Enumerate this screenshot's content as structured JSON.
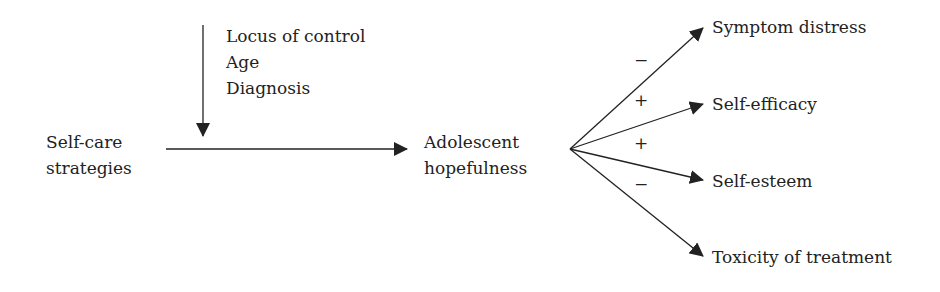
{
  "moderators": [
    "Locus of control",
    "Age",
    "Diagnosis"
  ],
  "source": {
    "line1": "Self-care",
    "line2": "strategies"
  },
  "mediator": {
    "line1": "Adolescent",
    "line2": "hopefulness"
  },
  "outcomes": [
    {
      "label": "Symptom distress",
      "sign": "−"
    },
    {
      "label": "Self-efficacy",
      "sign": "+"
    },
    {
      "label": "Self-esteem",
      "sign": "+"
    },
    {
      "label": "Toxicity of treatment",
      "sign": "−"
    }
  ],
  "colors": {
    "line": "#222222",
    "text": "#222222"
  }
}
